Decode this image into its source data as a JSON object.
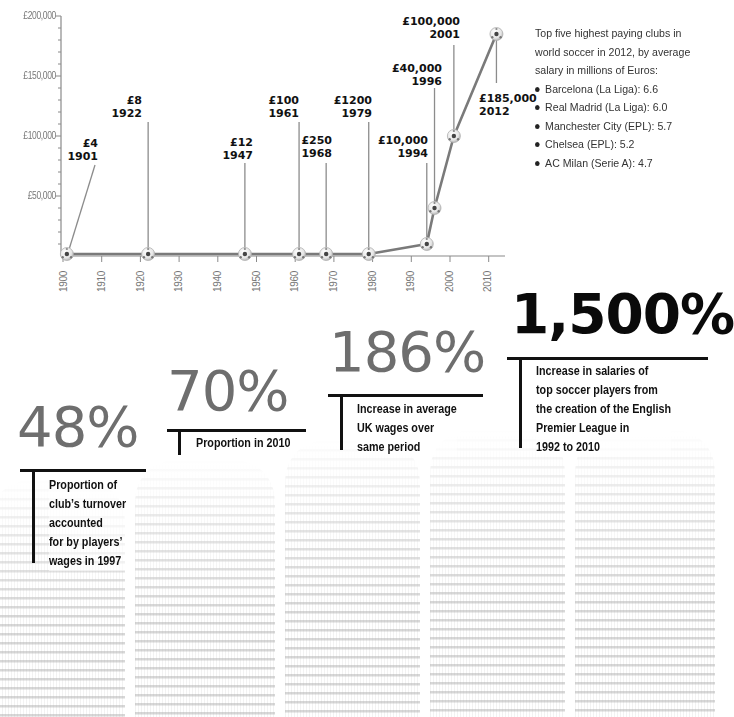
{
  "chart_data": {
    "type": "line",
    "title": "",
    "xlabel": "",
    "ylabel": "",
    "x": [
      1901,
      1922,
      1947,
      1961,
      1968,
      1979,
      1994,
      1996,
      2001,
      2012
    ],
    "values": [
      4,
      8,
      12,
      100,
      250,
      1200,
      10000,
      40000,
      100000,
      185000
    ],
    "series": [
      {
        "name": "Top player wages (£)",
        "x": [
          1901,
          1922,
          1947,
          1961,
          1968,
          1979,
          1994,
          1996,
          2001,
          2012
        ],
        "values": [
          4,
          8,
          12,
          100,
          250,
          1200,
          10000,
          40000,
          100000,
          185000
        ]
      }
    ],
    "annotations": [
      {
        "value": "£4",
        "year": "1901"
      },
      {
        "value": "£8",
        "year": "1922"
      },
      {
        "value": "£12",
        "year": "1947"
      },
      {
        "value": "£100",
        "year": "1961"
      },
      {
        "value": "£250",
        "year": "1968"
      },
      {
        "value": "£1200",
        "year": "1979"
      },
      {
        "value": "£10,000",
        "year": "1994"
      },
      {
        "value": "£40,000",
        "year": "1996"
      },
      {
        "value": "£100,000",
        "year": "2001"
      },
      {
        "value": "£185,000",
        "year": "2012"
      }
    ],
    "y_ticks": [
      "£50,000",
      "£100,000",
      "£150,000",
      "£200,000"
    ],
    "x_ticks": [
      "1900",
      "1910",
      "1920",
      "1930",
      "1940",
      "1950",
      "1960",
      "1970",
      "1980",
      "1990",
      "2000",
      "2010"
    ],
    "xlim": [
      1900,
      2015
    ],
    "ylim": [
      0,
      200000
    ],
    "grid": false,
    "legend": "none",
    "marker": "soccer-ball"
  },
  "side_panel": {
    "intro": "Top five highest paying clubs in world soccer in 2012, by average salary in millions of Euros:",
    "clubs": [
      {
        "label": "Barcelona (La Liga): 6.6",
        "club": "Barcelona",
        "league": "La Liga",
        "value": 6.6
      },
      {
        "label": "Real Madrid (La Liga): 6.0",
        "club": "Real Madrid",
        "league": "La Liga",
        "value": 6.0
      },
      {
        "label": "Manchester City (EPL): 5.7",
        "club": "Manchester City",
        "league": "EPL",
        "value": 5.7
      },
      {
        "label": "Chelsea (EPL): 5.2",
        "club": "Chelsea",
        "league": "EPL",
        "value": 5.2
      },
      {
        "label": "AC Milan (Serie A): 4.7",
        "club": "AC Milan",
        "league": "Serie A",
        "value": 4.7
      }
    ]
  },
  "stats": [
    {
      "value": "48%",
      "lines": [
        "Proportion  of",
        "club’s turnover",
        "accounted",
        "for by players’",
        "wages in 1997"
      ]
    },
    {
      "value": "70%",
      "lines": [
        "Proportion in 2010"
      ]
    },
    {
      "value": "186%",
      "lines": [
        "Increase in average",
        "UK wages over",
        "same period"
      ]
    },
    {
      "value": "1,500%",
      "lines": [
        "Increase in salaries of",
        "top soccer players from",
        "the creation of the English",
        "Premier League in",
        "1992 to 2010"
      ]
    }
  ],
  "colors": {
    "line": "#7a7a7a",
    "axis": "#8a8a8a",
    "stat_grey": "#6e6e6e",
    "stat_dark": "#0a0a0a",
    "text": "#111111"
  }
}
